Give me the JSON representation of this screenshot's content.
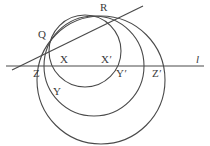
{
  "figure": {
    "background_color": "#ffffff",
    "stroke_color": "#4a4a4a",
    "label_color": "#3a3a3a",
    "labels": [
      {
        "id": "R",
        "text": "R",
        "x": 100,
        "y": 2,
        "style": "plain"
      },
      {
        "id": "Q",
        "text": "Q",
        "x": 38,
        "y": 29,
        "style": "plain"
      },
      {
        "id": "X",
        "text": "X",
        "x": 60,
        "y": 54,
        "style": "plain"
      },
      {
        "id": "Xp",
        "text": "X′",
        "x": 101,
        "y": 54,
        "style": "prime"
      },
      {
        "id": "l",
        "text": "l",
        "x": 196,
        "y": 54,
        "style": "italic"
      },
      {
        "id": "Z",
        "text": "Z",
        "x": 33,
        "y": 68,
        "style": "plain"
      },
      {
        "id": "Yp",
        "text": "Y′",
        "x": 116,
        "y": 68,
        "style": "prime"
      },
      {
        "id": "Zp",
        "text": "Z′",
        "x": 152,
        "y": 68,
        "style": "prime"
      },
      {
        "id": "Y",
        "text": "Y",
        "x": 53,
        "y": 86,
        "style": "plain"
      }
    ],
    "line_l": {
      "name": "horizontal-line-l",
      "x1": 6,
      "y1": 66,
      "x2": 204,
      "y2": 66
    },
    "line_qr": {
      "name": "secant-line-through-Q-and-R",
      "x1": 12,
      "y1": 70,
      "x2": 143,
      "y2": 6
    },
    "circles": [
      {
        "id": "circle-small",
        "cx": 85,
        "cy": 51,
        "r": 36
      },
      {
        "id": "circle-medium",
        "cx": 94,
        "cy": 66,
        "r": 50
      },
      {
        "id": "circle-large",
        "cx": 101,
        "cy": 80,
        "r": 64
      }
    ]
  }
}
